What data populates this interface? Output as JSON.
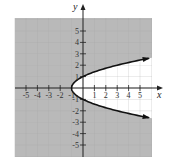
{
  "chart_data": {
    "type": "inequality-graph",
    "title": "",
    "xlabel": "x",
    "ylabel": "y",
    "xlim": [
      -6,
      6
    ],
    "ylim": [
      -6,
      6
    ],
    "grid": true,
    "x_ticks": [
      -5,
      -4,
      -3,
      -2,
      -1,
      1,
      2,
      3,
      4,
      5
    ],
    "y_ticks": [
      -5,
      -4,
      -3,
      -2,
      -1,
      1,
      2,
      3,
      4,
      5
    ],
    "x_tick_labels": [
      "-5",
      "-4",
      "-3",
      "-2",
      "-1",
      "1",
      "2",
      "3",
      "4",
      "5"
    ],
    "y_tick_labels": [
      "-5",
      "-4",
      "-3",
      "-2",
      "-1",
      "1",
      "2",
      "3",
      "4",
      "5"
    ],
    "boundary": {
      "equation": "x = y^2 - 1",
      "style": "solid",
      "vertex": [
        -1,
        0
      ],
      "opens": "right",
      "y_range": [
        -2.6,
        2.6
      ],
      "arrows": "both ends"
    },
    "shaded_region": "x <= y^2 - 1 (outside the parabola)",
    "colors": {
      "shade": "#b9b9b9",
      "unshaded": "#ffffff",
      "curve": "#111111",
      "axes": "#222222",
      "grid": "#a8a8a8"
    }
  },
  "labels": {
    "x_axis": "x",
    "y_axis": "y"
  }
}
